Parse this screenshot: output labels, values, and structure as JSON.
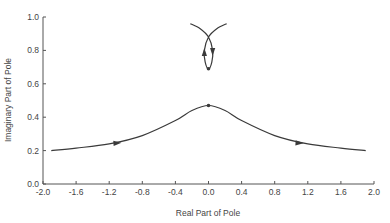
{
  "chart_data": {
    "type": "line",
    "title": "",
    "xlabel": "Real Part of Pole",
    "ylabel": "Imaginary Part of Pole",
    "xlim": [
      -2.0,
      2.0
    ],
    "ylim": [
      0.0,
      1.0
    ],
    "grid": false,
    "legend": null,
    "x_ticks": [
      "-2.0",
      "-1.6",
      "-1.2",
      "-0.8",
      "-0.4",
      "0.0",
      "0.4",
      "0.8",
      "1.2",
      "1.6",
      "2.0"
    ],
    "y_ticks": [
      "0.0",
      "0.2",
      "0.4",
      "0.6",
      "0.8",
      "1.0"
    ],
    "series": [
      {
        "name": "lower-locus",
        "description": "Bell-shaped pole locus, arrows pointing outward (left-to-right on left branch, left-to-right on right branch), dot at peak",
        "x": [
          -1.9,
          -1.6,
          -1.2,
          -0.8,
          -0.4,
          -0.2,
          0.0,
          0.2,
          0.4,
          0.8,
          1.2,
          1.6,
          1.9
        ],
        "y": [
          0.2,
          0.215,
          0.24,
          0.29,
          0.38,
          0.44,
          0.47,
          0.44,
          0.38,
          0.29,
          0.24,
          0.215,
          0.2
        ],
        "marker_at": {
          "x": 0.0,
          "y": 0.47
        },
        "arrows_at_x": [
          -1.1,
          1.1
        ]
      },
      {
        "name": "upper-loop",
        "description": "Crossing loop near top center, two branches cross at ~0.88 and form a closed loop bottoming at ~0.69 with a dot and arrows",
        "x": [
          -0.22,
          -0.1,
          0.0,
          0.05,
          0.04,
          0.0,
          -0.04,
          -0.05,
          0.0,
          0.1,
          0.22
        ],
        "y": [
          0.96,
          0.93,
          0.88,
          0.8,
          0.73,
          0.69,
          0.73,
          0.8,
          0.88,
          0.93,
          0.96
        ],
        "marker_at": {
          "x": 0.0,
          "y": 0.69
        }
      }
    ]
  },
  "colors": {
    "line": "#3a3a3a",
    "axis": "#555555",
    "text": "#444444"
  }
}
